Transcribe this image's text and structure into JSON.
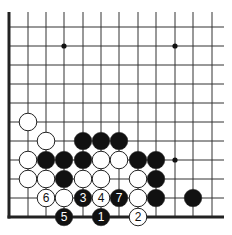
{
  "diagram": {
    "type": "go-board-fragment",
    "orientation": "bottom-left corner",
    "colors": {
      "background": "#ffffff",
      "line": "#333333",
      "edge": "#222222",
      "black_stone": "#111111",
      "white_stone": "#ffffff",
      "stone_outline": "#222222"
    },
    "grid": {
      "columns_x": [
        9,
        28,
        46,
        64,
        83,
        101,
        119,
        138,
        156,
        175,
        193,
        212
      ],
      "rows_y": [
        27,
        46,
        65,
        84,
        103,
        122,
        141,
        160,
        179,
        198,
        217
      ],
      "top_open_to_y": 12,
      "right_open_to_x": 224,
      "left_edge_x": 9,
      "bottom_edge_y": 217
    },
    "star_points": [
      {
        "col": 3,
        "row": 1
      },
      {
        "col": 9,
        "row": 1
      },
      {
        "col": 9,
        "row": 7
      }
    ],
    "stones": [
      {
        "col": 1,
        "row": 5,
        "color": "white",
        "label": ""
      },
      {
        "col": 2,
        "row": 6,
        "color": "white",
        "label": ""
      },
      {
        "col": 4,
        "row": 6,
        "color": "black",
        "label": ""
      },
      {
        "col": 5,
        "row": 6,
        "color": "black",
        "label": ""
      },
      {
        "col": 6,
        "row": 6,
        "color": "black",
        "label": ""
      },
      {
        "col": 1,
        "row": 7,
        "color": "white",
        "label": ""
      },
      {
        "col": 2,
        "row": 7,
        "color": "black",
        "label": ""
      },
      {
        "col": 3,
        "row": 7,
        "color": "black",
        "label": ""
      },
      {
        "col": 4,
        "row": 7,
        "color": "black",
        "label": ""
      },
      {
        "col": 5,
        "row": 7,
        "color": "white",
        "label": ""
      },
      {
        "col": 6,
        "row": 7,
        "color": "white",
        "label": ""
      },
      {
        "col": 7,
        "row": 7,
        "color": "black",
        "label": ""
      },
      {
        "col": 8,
        "row": 7,
        "color": "black",
        "label": ""
      },
      {
        "col": 1,
        "row": 8,
        "color": "white",
        "label": ""
      },
      {
        "col": 2,
        "row": 8,
        "color": "white",
        "label": ""
      },
      {
        "col": 3,
        "row": 8,
        "color": "black",
        "label": ""
      },
      {
        "col": 4,
        "row": 8,
        "color": "white",
        "label": ""
      },
      {
        "col": 5,
        "row": 8,
        "color": "white",
        "label": ""
      },
      {
        "col": 7,
        "row": 8,
        "color": "white",
        "label": ""
      },
      {
        "col": 8,
        "row": 8,
        "color": "black",
        "label": ""
      },
      {
        "col": 2,
        "row": 9,
        "color": "white",
        "label": "6"
      },
      {
        "col": 3,
        "row": 9,
        "color": "white",
        "label": ""
      },
      {
        "col": 4,
        "row": 9,
        "color": "black",
        "label": "3"
      },
      {
        "col": 5,
        "row": 9,
        "color": "white",
        "label": "4"
      },
      {
        "col": 6,
        "row": 9,
        "color": "black",
        "label": "7"
      },
      {
        "col": 7,
        "row": 9,
        "color": "white",
        "label": ""
      },
      {
        "col": 8,
        "row": 9,
        "color": "black",
        "label": ""
      },
      {
        "col": 10,
        "row": 9,
        "color": "black",
        "label": ""
      },
      {
        "col": 3,
        "row": 10,
        "color": "black",
        "label": "5"
      },
      {
        "col": 5,
        "row": 10,
        "color": "black",
        "label": "1"
      },
      {
        "col": 7,
        "row": 10,
        "color": "white",
        "label": "2"
      }
    ],
    "move_sequence": [
      "1",
      "2",
      "3",
      "4",
      "5",
      "6",
      "7"
    ]
  }
}
